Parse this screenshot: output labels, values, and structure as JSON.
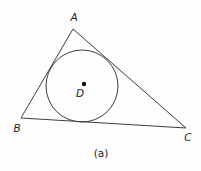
{
  "figure": {
    "background": "#fdfdfd",
    "line_color": "#3d3d3d",
    "text_color": "#222222",
    "dot_color": "#111111",
    "triangle": {
      "points": "73,29 21,118 186,128"
    },
    "incircle": {
      "cx": 82,
      "cy": 86,
      "r": 36
    },
    "center_dot": {
      "cx": 84,
      "cy": 84,
      "r": 2.2
    },
    "labels": [
      {
        "text": "A",
        "x": 74,
        "y": 21
      },
      {
        "text": "B",
        "x": 17,
        "y": 132
      },
      {
        "text": "C",
        "x": 188,
        "y": 141
      },
      {
        "text": "D",
        "x": 80,
        "y": 97
      }
    ],
    "caption": "(a)",
    "caption_pos": {
      "x": 101,
      "y": 157
    }
  }
}
